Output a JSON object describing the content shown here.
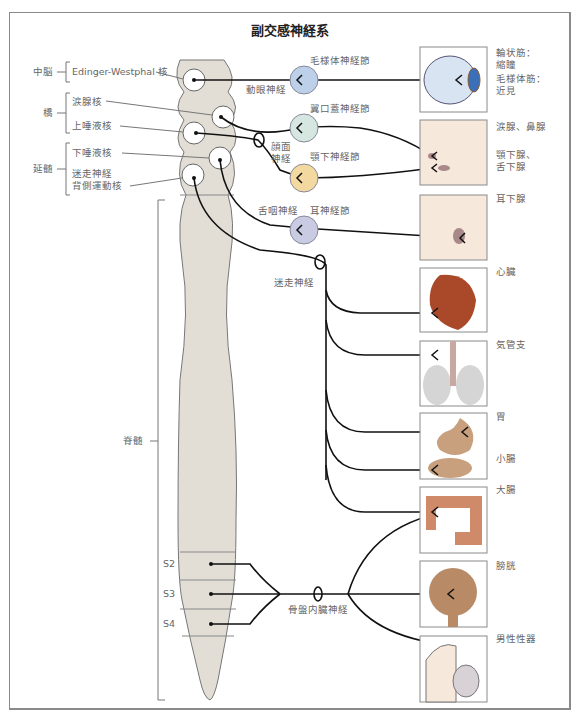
{
  "title": "副交感神経系",
  "regions": {
    "midbrain": "中脳",
    "pons": "橋",
    "medulla": "延髄",
    "spinal_cord": "脊髄"
  },
  "nuclei": {
    "edinger_westphal": "Edinger-Westphal 核",
    "lacrimal": "涙腺核",
    "superior_salivatory": "上唾液核",
    "inferior_salivatory": "下唾液核",
    "vagus_dorsal_motor_line1": "迷走神経",
    "vagus_dorsal_motor_line2": "背側運動核"
  },
  "nerves": {
    "oculomotor": "動眼神経",
    "facial_line1": "顔面",
    "facial_line2": "神経",
    "glossopharyngeal": "舌咽神経",
    "vagus": "迷走神経",
    "pelvic_splanchnic": "骨盤内臓神経"
  },
  "ganglia": [
    {
      "label": "毛様体神経節",
      "color": "#bcd0ea"
    },
    {
      "label": "翼口蓋神経節",
      "color": "#d6e6e0"
    },
    {
      "label": "顎下神経節",
      "color": "#f3d9a0"
    },
    {
      "label": "耳神経節",
      "color": "#c9cbe3"
    }
  ],
  "sacral_segments": [
    "S2",
    "S3",
    "S4"
  ],
  "targets": [
    {
      "label_line1": "輪状筋：",
      "label_line2": "縮瞳",
      "label_line3": "毛様体筋：",
      "label_line4": "近見"
    },
    {
      "label_line1": "涙腺、鼻腺",
      "label_line2": "顎下腺、",
      "label_line3": "舌下腺"
    },
    {
      "label_line1": "耳下腺"
    },
    {
      "label_line1": "心臓"
    },
    {
      "label_line1": "気管支"
    },
    {
      "label_line1": "胃",
      "label_line2": "小腸"
    },
    {
      "label_line1": "大腸"
    },
    {
      "label_line1": "膀胱"
    },
    {
      "label_line1": "男性性器"
    }
  ],
  "colors": {
    "spinal_cord_fill": "#e2ded6",
    "nerve_stroke": "#111111",
    "heart": "#a9492a",
    "gut": "#c8a07e",
    "colon": "#cf8a6a",
    "bladder": "#b88a66",
    "skin": "#f7e8dc"
  }
}
